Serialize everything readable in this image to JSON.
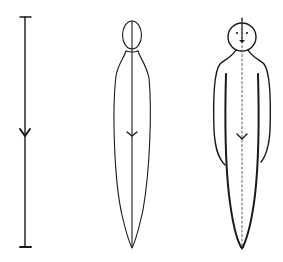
{
  "diagram": {
    "ink_color": "#1a1a1a",
    "background": "#ffffff",
    "figures": [
      {
        "id": "stage-1",
        "label": "center line",
        "elements": [
          "vertical-line",
          "top-cap",
          "bottom-cap",
          "center-arrow"
        ]
      },
      {
        "id": "stage-2",
        "label": "spindle body",
        "elements": [
          "center-line",
          "oval-head",
          "spindle-body",
          "center-arrow"
        ]
      },
      {
        "id": "stage-3",
        "label": "complete figure",
        "elements": [
          "center-line",
          "round-head",
          "eyes",
          "mouth",
          "torso",
          "left-arm",
          "right-arm",
          "center-arrow"
        ]
      }
    ]
  }
}
